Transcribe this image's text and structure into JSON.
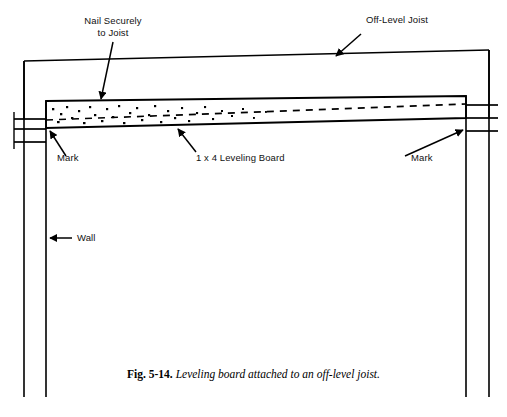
{
  "figure": {
    "caption_figure_number": "Fig. 5-14.",
    "caption_text": "Leveling board attached to an off-level joist.",
    "ink_color": "#000000",
    "background_color": "#ffffff"
  },
  "labels": {
    "nail_securely": "Nail Securely\nto Joist",
    "off_level_joist": "Off-Level Joist",
    "mark_left": "Mark",
    "mark_right": "Mark",
    "wall": "Wall",
    "leveling_board": "1 x 4 Leveling Board"
  },
  "parts": {
    "joist_name": "off-level-joist",
    "board_name": "leveling-board",
    "wall_left_name": "left-wall",
    "wall_right_name": "right-wall",
    "mark_left_name": "left-mark-lines",
    "mark_right_name": "right-mark-lines",
    "nail_stipple_name": "nail-stipple"
  }
}
